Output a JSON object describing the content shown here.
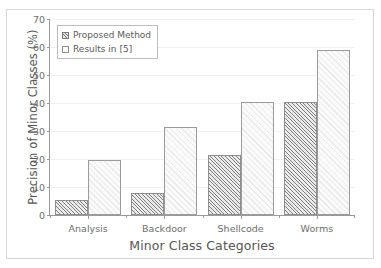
{
  "chart_data": {
    "type": "bar",
    "title": "",
    "xlabel": "Minor Class Categories",
    "ylabel": "Precision of Minor Classes (%)",
    "categories": [
      "Analysis",
      "Backdoor",
      "Shellcode",
      "Worms"
    ],
    "series": [
      {
        "name": "Proposed Method",
        "values": [
          5.5,
          8,
          21.5,
          40.5
        ]
      },
      {
        "name": "Results in [5]",
        "values": [
          19.5,
          31.5,
          40.5,
          59
        ]
      }
    ],
    "ylim": [
      0,
      70
    ],
    "yticks": [
      0,
      10,
      20,
      30,
      40,
      50,
      60,
      70
    ],
    "ytick_labels": [
      "0",
      "10",
      "20",
      "30",
      "40",
      "50",
      "60",
      "70"
    ],
    "grid": true,
    "legend_position": "upper left",
    "colors": {
      "proposed_hatch": "#7d7d7d",
      "proposed_fill": "#ececec",
      "results_fill": "#fafafa",
      "axis": "#9a9a9a",
      "text": "#5a5a5a"
    }
  },
  "legend": {
    "items": [
      {
        "label": "Proposed Method",
        "style": "proposed"
      },
      {
        "label": "Results in [5]",
        "style": "results"
      }
    ]
  }
}
